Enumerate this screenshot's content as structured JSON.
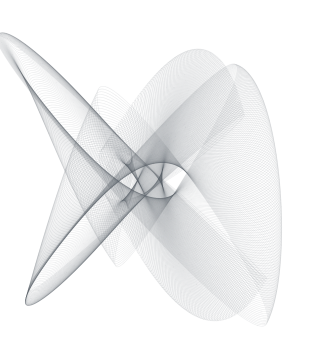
{
  "page": {
    "background": "#ffffff",
    "width": 314,
    "height": 344
  },
  "artwork": {
    "type": "harmonograph",
    "description": "Abstract generative line art: a damped, slowly precessing Lissajous (harmonograph) curve traced thousands of times, forming a translucent fishnet mesh with folded shell-like lobes. Light cool-gray strokes on a white background; figure is clipped at the left edge, with a large rounded lobe at bottom-left, a concentric fan shell at right, and a darker fold ridge sweeping diagonally from upper-left to mid-right.",
    "background": "#ffffff",
    "stroke_color": "#5d636e",
    "stroke_opacity": 0.13,
    "stroke_width": 0.55,
    "render_scale": 2,
    "canvas": {
      "width": 314,
      "height": 344
    },
    "center": {
      "x": 146,
      "y": 181
    },
    "time": {
      "start": 0,
      "end": 700,
      "step": 0.01,
      "chunk": 50
    },
    "oscillators": {
      "x": [
        {
          "amplitude": 84,
          "frequency": 2.0,
          "phase": 1.5707963,
          "damping": 0.00035
        },
        {
          "amplitude": 66,
          "frequency": 3.0047,
          "phase": 0.0,
          "damping": 0.00035
        }
      ],
      "y": [
        {
          "amplitude": 86,
          "frequency": 3.0,
          "phase": 0.0,
          "damping": 0.00035
        },
        {
          "amplitude": 66,
          "frequency": 2.0063,
          "phase": 1.0471975,
          "damping": 0.00035
        }
      ]
    }
  }
}
